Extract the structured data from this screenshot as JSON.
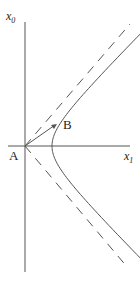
{
  "diagram": {
    "title": "",
    "labels": {
      "vertical_axis": "x",
      "vertical_axis_sub": "0",
      "horizontal_axis": "x",
      "horizontal_axis_sub": "1",
      "point_a": "A",
      "point_b": "B"
    },
    "elements": [
      "vertical axis x0",
      "horizontal axis x1",
      "hyperbola branch (right)",
      "dashed asymptote x0 = x1",
      "dashed asymptote x0 = -x1",
      "vector from A to B"
    ],
    "colors": {
      "stroke": "#555555",
      "text": "#222222"
    }
  }
}
